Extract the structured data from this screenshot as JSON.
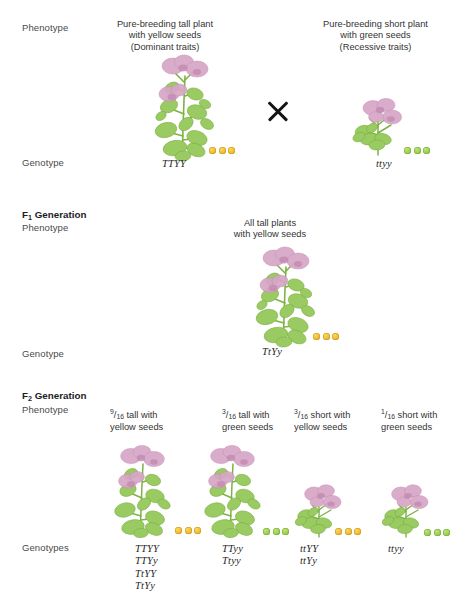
{
  "diagram": {
    "colors": {
      "yellow_seed": "#f0bc33",
      "green_seed": "#9ccf50",
      "flower_pink": "#d9a7c7",
      "leaf_green": "#8fc45a",
      "stem_green": "#7cb342",
      "text": "#3a3a3a"
    }
  },
  "row_labels": {
    "phenotype": "Phenotype",
    "genotype": "Genotype",
    "genotypes_plural": "Genotypes"
  },
  "parental": {
    "left": {
      "caption_line1": "Pure-breeding tall plant",
      "caption_line2": "with yellow seeds",
      "caption_line3": "(Dominant traits)",
      "genotype": "TTYY",
      "seed_color": "yellow",
      "seed_count": 3,
      "plant_type": "tall"
    },
    "cross_symbol": "×",
    "right": {
      "caption_line1": "Pure-breeding short plant",
      "caption_line2": "with green seeds",
      "caption_line3": "(Recessive traits)",
      "genotype": "ttyy",
      "seed_color": "green",
      "seed_count": 3,
      "plant_type": "short"
    }
  },
  "f1": {
    "header_letter": "F",
    "header_subscript": "1",
    "header_word": "Generation",
    "caption_line1": "All tall plants",
    "caption_line2": "with yellow seeds",
    "genotype": "TtYy",
    "seed_color": "yellow",
    "seed_count": 3,
    "plant_type": "tall"
  },
  "f2": {
    "header_letter": "F",
    "header_subscript": "2",
    "header_word": "Generation",
    "columns": [
      {
        "fraction_numerator": "9",
        "fraction_denominator": "16",
        "caption_line1": "tall with",
        "caption_line2": "yellow seeds",
        "genotypes": [
          "TTYY",
          "TTYy",
          "TtYY",
          "TtYy"
        ],
        "seed_color": "yellow",
        "seed_count": 3,
        "plant_type": "tall"
      },
      {
        "fraction_numerator": "3",
        "fraction_denominator": "16",
        "caption_line1": "tall with",
        "caption_line2": "green seeds",
        "genotypes": [
          "TTyy",
          "Ttyy"
        ],
        "seed_color": "green",
        "seed_count": 3,
        "plant_type": "tall"
      },
      {
        "fraction_numerator": "3",
        "fraction_denominator": "16",
        "caption_line1": "short with",
        "caption_line2": "yellow seeds",
        "genotypes": [
          "ttYY",
          "ttYy"
        ],
        "seed_color": "yellow",
        "seed_count": 3,
        "plant_type": "short"
      },
      {
        "fraction_numerator": "1",
        "fraction_denominator": "16",
        "caption_line1": "short with",
        "caption_line2": "green seeds",
        "genotypes": [
          "ttyy"
        ],
        "seed_color": "green",
        "seed_count": 3,
        "plant_type": "short"
      }
    ]
  }
}
